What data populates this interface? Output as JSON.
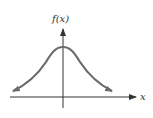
{
  "diagram": {
    "y_axis_label": "f(x)",
    "x_axis_label": "x",
    "curve_color": "#6b6b6b",
    "axis_color": "#333333",
    "curve_type": "gaussian (normal distribution)"
  }
}
